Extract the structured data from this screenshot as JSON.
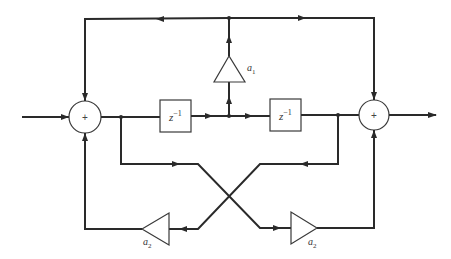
{
  "blocks": {
    "adder_left": {
      "symbol": "+"
    },
    "adder_right": {
      "symbol": "+"
    },
    "delay_1": {
      "label": "z",
      "exponent": "−1"
    },
    "delay_2": {
      "label": "z",
      "exponent": "−1"
    },
    "gain_a1": {
      "label": "a",
      "subscript": "1"
    },
    "gain_a2_left": {
      "label": "a",
      "subscript": "2"
    },
    "gain_a2_right": {
      "label": "a",
      "subscript": "2"
    }
  },
  "colors": {
    "stroke": "#2a2a2a",
    "background": "#ffffff"
  }
}
